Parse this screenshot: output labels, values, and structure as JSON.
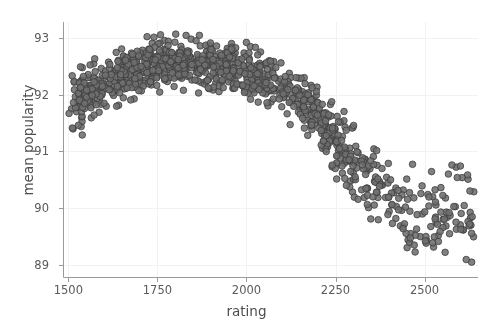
{
  "chart_data": {
    "type": "scatter",
    "title": "",
    "xlabel": "rating",
    "ylabel": "mean popularity",
    "xlim": [
      1485,
      2650
    ],
    "ylim": [
      88.78,
      93.28
    ],
    "xticks": [
      1500,
      1750,
      2000,
      2250,
      2500
    ],
    "yticks": [
      89,
      90,
      91,
      92,
      93
    ],
    "xtick_labels": [
      "1500",
      "1750",
      "2000",
      "2250",
      "2500"
    ],
    "ytick_labels": [
      "89",
      "90",
      "91",
      "92",
      "93"
    ],
    "grid": true,
    "grid_color": "#f2f2f2",
    "legend": false,
    "marker": {
      "shape": "circle",
      "size": 6.6,
      "fill_color": "#6e6e6e",
      "edge_color": "#3d3d3d",
      "opacity": 0.88
    },
    "axis_color": "#9a9a9a",
    "background_color": "#ffffff",
    "n_points": 1180,
    "trend": {
      "description": "Rises steeply from ~91.5 at rating 1500 to a peak near 92.6 around rating 1780, stays roughly flat to 2050, then declines steadily to ~89.6 by rating 2600. Vertical scatter spread widens at high ratings.",
      "control_x": [
        1500,
        1550,
        1600,
        1650,
        1700,
        1750,
        1800,
        1850,
        1900,
        1950,
        2000,
        2050,
        2100,
        2150,
        2200,
        2250,
        2300,
        2350,
        2400,
        2450,
        2500,
        2550,
        2600,
        2640
      ],
      "control_y": [
        91.62,
        91.98,
        92.2,
        92.36,
        92.48,
        92.56,
        92.58,
        92.56,
        92.52,
        92.46,
        92.4,
        92.3,
        92.14,
        91.92,
        91.6,
        91.2,
        90.78,
        90.42,
        90.16,
        89.98,
        89.86,
        89.78,
        89.7,
        89.66
      ],
      "spread_x": [
        1500,
        1600,
        1750,
        1900,
        2050,
        2200,
        2350,
        2500,
        2640
      ],
      "spread_y": [
        0.26,
        0.2,
        0.2,
        0.2,
        0.2,
        0.24,
        0.3,
        0.42,
        0.46
      ],
      "density_x": [
        1500,
        1600,
        1700,
        1800,
        1900,
        2000,
        2100,
        2200,
        2300,
        2400,
        2500,
        2600
      ],
      "density_weight": [
        0.55,
        1.0,
        1.0,
        1.0,
        0.95,
        0.9,
        0.85,
        0.8,
        0.6,
        0.45,
        0.4,
        0.3
      ]
    },
    "observed_y_range": [
      88.95,
      93.08
    ]
  },
  "figure": {
    "width": 493,
    "height": 325
  }
}
